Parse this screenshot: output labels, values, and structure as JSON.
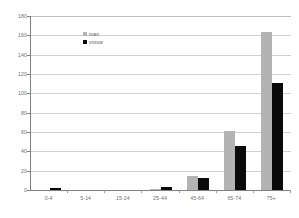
{
  "chart_data": {
    "type": "bar",
    "title": "",
    "subtitle": "",
    "xlabel": "",
    "ylabel": "",
    "categories": [
      "0-4",
      "5-14",
      "15-24",
      "25-44",
      "45-64",
      "65-74",
      "75+"
    ],
    "series": [
      {
        "name": "man",
        "color": "#b3b3b3",
        "values": [
          0,
          0,
          0,
          1,
          14,
          61,
          163
        ]
      },
      {
        "name": "vrouw",
        "color": "#0a0a0a",
        "values": [
          2,
          0,
          0,
          3,
          12,
          46,
          111
        ]
      }
    ],
    "ylim": [
      0,
      180
    ],
    "ytick_step": 20,
    "yticks": [
      180,
      160,
      140,
      120,
      100,
      80,
      60,
      40,
      20,
      0
    ],
    "ytick_labels": [
      "180",
      "160",
      "140",
      "120",
      "100",
      "80",
      "60",
      "40",
      "20",
      "0"
    ],
    "grid": true,
    "grid_axis": "y",
    "legend_position": "top-left",
    "bar_mode": "grouped"
  },
  "legend": {
    "items": [
      {
        "label": "man",
        "swatch": "gray-square-swatch"
      },
      {
        "label": "vrouw",
        "swatch": "black-square-swatch"
      }
    ]
  },
  "colors": {
    "man": "#b3b3b3",
    "vrouw": "#0a0a0a",
    "gridline": "#d0d0d0",
    "axis": "#808080",
    "tick_text": "#6f6f6f",
    "background": "#ffffff"
  }
}
